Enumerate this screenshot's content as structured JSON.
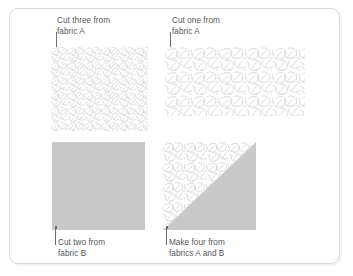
{
  "figure": {
    "frame_border_color": "#d9d9d9",
    "background_color": "#ffffff",
    "text_color": "#58585a",
    "fabric_b_color": "#c9c9c9",
    "fabric_a_line_color": "#c5c9c5"
  },
  "labels": {
    "top_left": "Cut three from\nfabric A",
    "top_right": "Cut one from\nfabric A",
    "bottom_left": "Cut two from\nfabric B",
    "bottom_right": "Make four from\nfabrics A and B"
  },
  "pieces": [
    {
      "id": "piece-top-left",
      "shape": "square",
      "fabric": "A",
      "fill": "leaf-print",
      "quantity": 3,
      "quantity_text": "three",
      "instruction": "Cut three from fabric A"
    },
    {
      "id": "piece-top-right",
      "shape": "rectangle",
      "fabric": "A",
      "fill": "leaf-print",
      "quantity": 1,
      "quantity_text": "one",
      "instruction": "Cut one from fabric A"
    },
    {
      "id": "piece-bottom-left",
      "shape": "square",
      "fabric": "B",
      "fill": "solid-gray",
      "quantity": 2,
      "quantity_text": "two",
      "instruction": "Cut two from fabric B"
    },
    {
      "id": "piece-bottom-right",
      "shape": "half-square-triangle",
      "fabric": "A and B",
      "fill": "leaf-print + solid-gray",
      "quantity": 4,
      "quantity_text": "four",
      "instruction": "Make four from fabrics A and B"
    }
  ]
}
